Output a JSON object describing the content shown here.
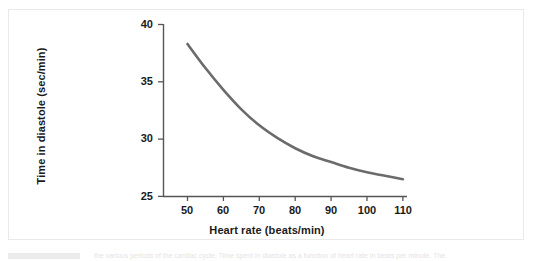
{
  "figure": {
    "caption_fragment": "the various periods of the cardiac cycle. Time spent in diastole as a function of heart rate in beats per minute. The"
  },
  "chart_data": {
    "type": "line",
    "title": "",
    "subtitle": "",
    "xlabel": "Heart rate (beats/min)",
    "ylabel": "Time in diastole (sec/min)",
    "xlim": [
      45,
      113
    ],
    "ylim": [
      25,
      40
    ],
    "xticks": [
      50,
      60,
      70,
      80,
      90,
      100,
      110
    ],
    "yticks": [
      25,
      30,
      35,
      40
    ],
    "xtick_labels": [
      "50",
      "60",
      "70",
      "80",
      "90",
      "100",
      "110"
    ],
    "ytick_labels": [
      "25",
      "30",
      "35",
      "40"
    ],
    "grid": false,
    "legend": false,
    "legend_position": "none",
    "line_color": "#6b6b6b",
    "line_width": 2.6,
    "axis_color": "#555555",
    "series": [
      {
        "name": "Time in diastole",
        "x": [
          50,
          55,
          60,
          65,
          70,
          75,
          80,
          85,
          90,
          95,
          100,
          105,
          110
        ],
        "values": [
          38.3,
          36.2,
          34.3,
          32.6,
          31.2,
          30.1,
          29.2,
          28.5,
          28.0,
          27.5,
          27.1,
          26.8,
          26.5
        ]
      }
    ]
  }
}
